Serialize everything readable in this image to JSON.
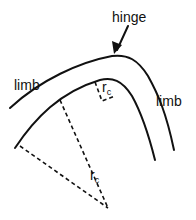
{
  "diagram": {
    "labels": {
      "hinge": "hinge",
      "limb_left": "limb",
      "limb_right": "limb",
      "radius_small": "r",
      "radius_small_sub": "c",
      "radius_large": "r",
      "radius_large_sub": "c"
    },
    "colors": {
      "stroke": "#111111",
      "background": "#ffffff"
    }
  }
}
